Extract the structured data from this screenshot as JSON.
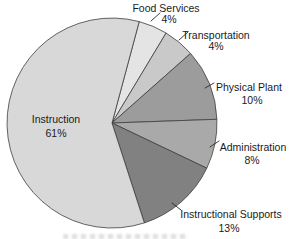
{
  "figure": {
    "background": "#ffffff",
    "text_color": "#1a1a1a",
    "outline_color": "#3f3f3f"
  },
  "chart_data": {
    "type": "pie",
    "title": "",
    "legend_position": "outside-callouts",
    "start_angle_deg": 15,
    "drawn_boundaries_deg": [
      15,
      31,
      48.5,
      88,
      115.5,
      162,
      375
    ],
    "categories": [
      "Food Services",
      "Transportation",
      "Physical Plant",
      "Administration",
      "Instructional Supports",
      "Instruction"
    ],
    "values": [
      4,
      4,
      10,
      8,
      13,
      61
    ],
    "slices": [
      {
        "label": "Food Services",
        "pct_label": "4%",
        "value": 4,
        "color": "#e4e4e4",
        "label_placement": "outside"
      },
      {
        "label": "Transportation",
        "pct_label": "4%",
        "value": 4,
        "color": "#c9c9c9",
        "label_placement": "outside"
      },
      {
        "label": "Physical Plant",
        "pct_label": "10%",
        "value": 10,
        "color": "#9c9c9c",
        "label_placement": "outside"
      },
      {
        "label": "Administration",
        "pct_label": "8%",
        "value": 8,
        "color": "#a9a9a9",
        "label_placement": "outside"
      },
      {
        "label": "Instructional Supports",
        "pct_label": "13%",
        "value": 13,
        "color": "#818181",
        "label_placement": "outside"
      },
      {
        "label": "Instruction",
        "pct_label": "61%",
        "value": 61,
        "color": "#d8d8d8",
        "label_placement": "inside"
      }
    ]
  }
}
